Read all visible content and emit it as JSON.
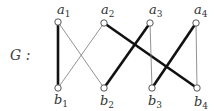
{
  "graph": {
    "name": "G",
    "label": "G :",
    "nodes": [
      {
        "id": "a1",
        "letter": "a",
        "index": "1",
        "x": 58,
        "y": 22,
        "lx": 57,
        "ly": 14
      },
      {
        "id": "a2",
        "letter": "a",
        "index": "2",
        "x": 104,
        "y": 23,
        "lx": 101,
        "ly": 14
      },
      {
        "id": "a3",
        "letter": "a",
        "index": "3",
        "x": 150,
        "y": 23,
        "lx": 149,
        "ly": 14
      },
      {
        "id": "a4",
        "letter": "a",
        "index": "4",
        "x": 196,
        "y": 23,
        "lx": 194,
        "ly": 14
      },
      {
        "id": "b1",
        "letter": "b",
        "index": "1",
        "x": 58,
        "y": 88,
        "lx": 54,
        "ly": 104
      },
      {
        "id": "b2",
        "letter": "b",
        "index": "2",
        "x": 104,
        "y": 88,
        "lx": 100,
        "ly": 105
      },
      {
        "id": "b3",
        "letter": "b",
        "index": "3",
        "x": 152,
        "y": 88,
        "lx": 148,
        "ly": 105
      },
      {
        "id": "b4",
        "letter": "b",
        "index": "4",
        "x": 197,
        "y": 88,
        "lx": 194,
        "ly": 106
      }
    ],
    "edges": [
      {
        "from": "a1",
        "to": "b1",
        "weight": "thick"
      },
      {
        "from": "a1",
        "to": "b2",
        "weight": "thin"
      },
      {
        "from": "a2",
        "to": "b1",
        "weight": "thin"
      },
      {
        "from": "a2",
        "to": "b4",
        "weight": "thick"
      },
      {
        "from": "a3",
        "to": "b2",
        "weight": "thick"
      },
      {
        "from": "a3",
        "to": "b3",
        "weight": "thin"
      },
      {
        "from": "a4",
        "to": "b3",
        "weight": "thick"
      },
      {
        "from": "a4",
        "to": "b4",
        "weight": "thin"
      }
    ],
    "colors": {
      "thick_edge": "#111111",
      "thin_edge": "#777777",
      "node_stroke": "#444444",
      "node_fill": "#ffffff"
    }
  }
}
